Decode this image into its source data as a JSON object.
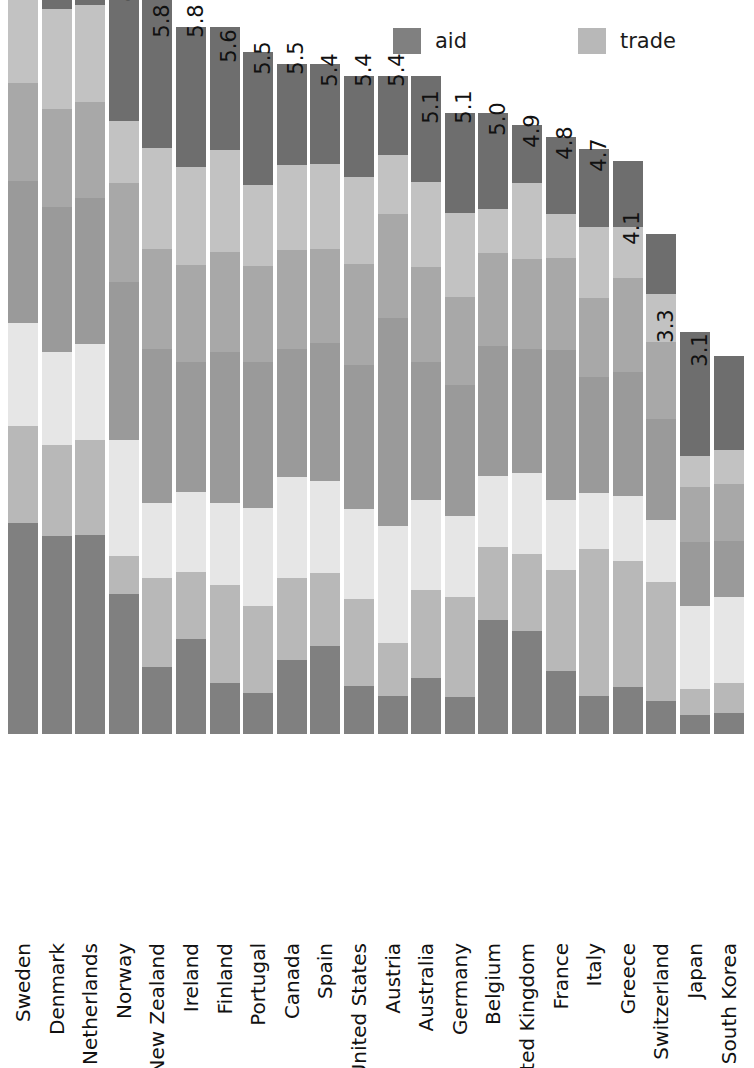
{
  "legend": {
    "position": "top-right",
    "entries": [
      {
        "label": "aid",
        "key": "aid",
        "color": "#808080"
      },
      {
        "label": "trade",
        "key": "trade",
        "color": "#b8b8b8"
      },
      {
        "label": "investment",
        "key": "investment",
        "color": "#e6e6e6"
      },
      {
        "label": "migration",
        "key": "migration",
        "color": "#9a9a9a"
      },
      {
        "label": "environment",
        "key": "environment",
        "color": "#a8a8a8"
      },
      {
        "label": "security",
        "key": "security",
        "color": "#c2c2c2"
      },
      {
        "label": "technology",
        "key": "technology",
        "color": "#6e6e6e"
      }
    ]
  },
  "chart_data": {
    "type": "bar",
    "subtype": "stacked-vertical",
    "title": "",
    "subtitle": "",
    "xlabel": "",
    "ylabel": "",
    "grid": false,
    "ylim": [
      0,
      7.0
    ],
    "legend_position": "top-right",
    "series_order_bottom_to_top": [
      "aid",
      "trade",
      "investment",
      "migration",
      "environment",
      "security",
      "technology"
    ],
    "colors": {
      "aid": "#808080",
      "trade": "#b8b8b8",
      "investment": "#e6e6e6",
      "migration": "#9a9a9a",
      "environment": "#a8a8a8",
      "security": "#c2c2c2",
      "technology": "#6e6e6e"
    },
    "categories": [
      "Sweden",
      "Denmark",
      "Netherlands",
      "Norway",
      "New Zealand",
      "Ireland",
      "Finland",
      "Portugal",
      "Canada",
      "Spain",
      "United States",
      "Austria",
      "Australia",
      "Germany",
      "Belgium",
      "United Kingdom",
      "France",
      "Italy",
      "Greece",
      "Switzerland",
      "Japan",
      "South Korea"
    ],
    "totals": [
      7.0,
      6.8,
      6.7,
      6.4,
      6.1,
      5.8,
      5.8,
      5.6,
      5.5,
      5.5,
      5.4,
      5.4,
      5.4,
      5.1,
      5.1,
      5.0,
      4.9,
      4.8,
      4.7,
      4.1,
      3.3,
      3.1
    ],
    "total_labels": [
      "7.0",
      "6.8",
      "6.7",
      "6.4",
      "6.1",
      "5.8",
      "5.8",
      "5.6",
      "5.5",
      "5.5",
      "5.4",
      "5.4",
      "5.4",
      "5.1",
      "5.1",
      "5.0",
      "4.9",
      "4.8",
      "4.7",
      "4.1",
      "3.3",
      "3.1"
    ],
    "series": [
      {
        "name": "aid",
        "values": [
          1.73,
          1.62,
          1.64,
          1.15,
          0.55,
          0.78,
          0.42,
          0.34,
          0.61,
          0.72,
          0.39,
          0.31,
          0.46,
          0.31,
          0.94,
          0.85,
          0.52,
          0.31,
          0.38,
          0.27,
          0.16,
          0.17
        ]
      },
      {
        "name": "trade",
        "values": [
          0.8,
          0.75,
          0.78,
          0.31,
          0.73,
          0.55,
          0.8,
          0.71,
          0.67,
          0.6,
          0.72,
          0.44,
          0.72,
          0.82,
          0.6,
          0.63,
          0.83,
          1.21,
          1.04,
          0.97,
          0.21,
          0.25
        ]
      },
      {
        "name": "investment",
        "values": [
          0.84,
          0.76,
          0.78,
          0.95,
          0.62,
          0.65,
          0.67,
          0.81,
          0.83,
          0.76,
          0.74,
          0.96,
          0.74,
          0.66,
          0.58,
          0.66,
          0.57,
          0.46,
          0.53,
          0.51,
          0.68,
          0.7
        ]
      },
      {
        "name": "migration",
        "values": [
          1.17,
          1.19,
          1.2,
          1.3,
          1.26,
          1.07,
          1.24,
          1.2,
          1.05,
          1.13,
          1.18,
          1.7,
          1.13,
          1.08,
          1.07,
          1.02,
          1.23,
          0.95,
          1.02,
          0.83,
          0.53,
          0.46
        ]
      },
      {
        "name": "environment",
        "values": [
          0.8,
          0.81,
          0.79,
          0.81,
          0.82,
          0.8,
          0.82,
          0.78,
          0.81,
          0.77,
          0.83,
          0.86,
          0.78,
          0.72,
          0.76,
          0.74,
          0.76,
          0.65,
          0.77,
          0.63,
          0.45,
          0.47
        ]
      },
      {
        "name": "security",
        "values": [
          0.82,
          0.82,
          0.8,
          0.51,
          0.83,
          0.8,
          0.84,
          0.67,
          0.7,
          0.7,
          0.71,
          0.48,
          0.7,
          0.69,
          0.36,
          0.62,
          0.36,
          0.58,
          0.42,
          0.4,
          0.25,
          0.28
        ]
      },
      {
        "name": "technology",
        "values": [
          0.84,
          0.85,
          0.71,
          1.37,
          1.29,
          1.15,
          1.01,
          1.09,
          0.83,
          0.82,
          0.83,
          0.65,
          0.87,
          0.82,
          0.79,
          0.48,
          0.63,
          0.64,
          0.54,
          0.49,
          1.02,
          0.77
        ]
      }
    ]
  }
}
